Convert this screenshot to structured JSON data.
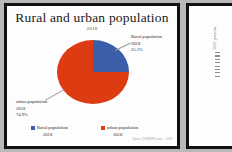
{
  "chart_data": {
    "type": "pie",
    "title": "Rural and urban population",
    "subtitle": "2018",
    "categories": [
      "Rural population 2018",
      "urban population 2018"
    ],
    "values": [
      25.1,
      74.9
    ],
    "unit": "%",
    "colors": [
      "#3a5ea8",
      "#dd3b11"
    ],
    "legend_position": "bottom",
    "labels": [
      {
        "name": "Rural population",
        "year": "2018",
        "value": "25.1%"
      },
      {
        "name": "urban population",
        "year": "2018",
        "value": "74.9%"
      }
    ]
  },
  "slide": {
    "title": "Rural and urban population",
    "subtitle": "2018",
    "source_note": "Source: SSSRRRR.com — 2018"
  },
  "callouts": {
    "rural": {
      "line1": "Rural population",
      "line2": "2018",
      "line3": "25.1%"
    },
    "urban": {
      "line1": "urban population",
      "line2": "2018",
      "line3": "74.9%"
    }
  },
  "legend": {
    "items": [
      {
        "label": "Rural population",
        "sublabel": "2018",
        "color": "#3a5ea8"
      },
      {
        "label": "urban population",
        "sublabel": "2018",
        "color": "#dd3b11"
      }
    ]
  },
  "right_slide": {
    "axis_label": "1000 persons"
  }
}
